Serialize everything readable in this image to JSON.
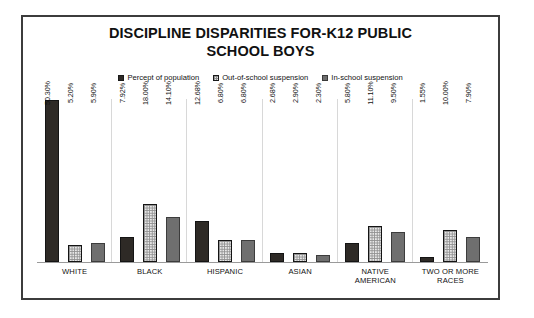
{
  "chart_data": {
    "type": "bar",
    "title": "DISCIPLINE DISPARITIES FOR-K12 PUBLIC SCHOOL BOYS",
    "title_lines": [
      "DISCIPLINE DISPARITIES FOR-K12 PUBLIC",
      "SCHOOL BOYS"
    ],
    "xlabel": "",
    "ylabel": "",
    "ylim": [
      0,
      52
    ],
    "grid": false,
    "legend_position": "top-center",
    "categories": [
      "WHITE",
      "BLACK",
      "HISPANIC",
      "ASIAN",
      "NATIVE AMERICAN",
      "TWO OR MORE RACES"
    ],
    "category_lines": [
      [
        "WHITE"
      ],
      [
        "BLACK"
      ],
      [
        "HISPANIC"
      ],
      [
        "ASIAN"
      ],
      [
        "NATIVE",
        "AMERICAN"
      ],
      [
        "TWO OR MORE",
        "RACES"
      ]
    ],
    "series": [
      {
        "name": "Percept of population",
        "swatch": "solid-dark",
        "color": "#2e2a26",
        "values": [
          50.3,
          7.92,
          12.68,
          2.68,
          5.8,
          1.55
        ],
        "labels": [
          "50.30%",
          "7.92%",
          "12.68%",
          "2.68%",
          "5.80%",
          "1.55%"
        ]
      },
      {
        "name": "Out-of-school suspension",
        "swatch": "checkered-light",
        "color": "#e8e8e8",
        "values": [
          5.2,
          18.0,
          6.8,
          2.9,
          11.1,
          10.0
        ],
        "labels": [
          "5.20%",
          "18.00%",
          "6.80%",
          "2.90%",
          "11.10%",
          "10.00%"
        ]
      },
      {
        "name": "In-school suspension",
        "swatch": "solid-gray",
        "color": "#6f6f6f",
        "values": [
          5.9,
          14.1,
          6.8,
          2.3,
          9.5,
          7.9
        ],
        "labels": [
          "5.90%",
          "14.10%",
          "6.80%",
          "2.30%",
          "9.50%",
          "7.90%"
        ]
      }
    ]
  }
}
